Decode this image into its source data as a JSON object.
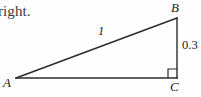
{
  "figure": {
    "context_text": "right.",
    "canvas": {
      "width": 201,
      "height": 97,
      "background": "#fefefe"
    },
    "stroke_color": "#2b2b2b",
    "triangle": {
      "type": "right-triangle",
      "vertices": [
        {
          "name": "A",
          "label": "A",
          "x": 16,
          "y": 78,
          "role": "acute-angle-left"
        },
        {
          "name": "B",
          "label": "B",
          "x": 177,
          "y": 18,
          "role": "acute-angle-top"
        },
        {
          "name": "C",
          "label": "C",
          "x": 177,
          "y": 78,
          "role": "right-angle"
        }
      ],
      "sides": [
        {
          "from": "A",
          "to": "B",
          "name": "hypotenuse",
          "label": "1"
        },
        {
          "from": "B",
          "to": "C",
          "name": "opposite-leg",
          "label": "0.3"
        },
        {
          "from": "A",
          "to": "C",
          "name": "adjacent-leg",
          "label": ""
        }
      ],
      "right_angle_marker": {
        "at": "C",
        "size": 9
      }
    }
  }
}
